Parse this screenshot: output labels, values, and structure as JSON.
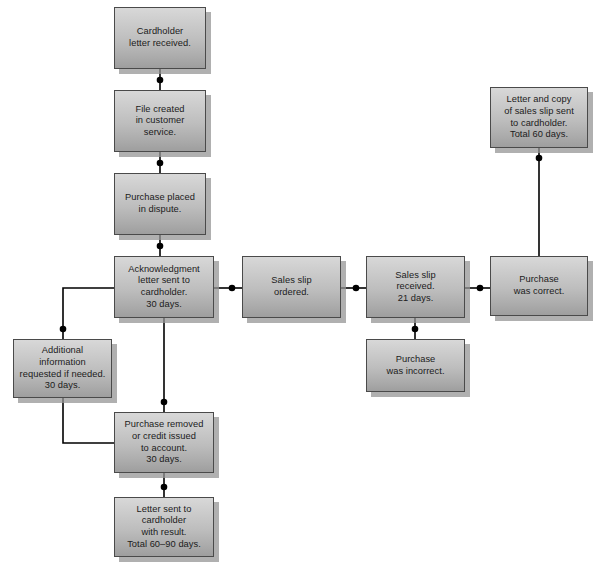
{
  "diagram": {
    "type": "flowchart",
    "background_color": "#ffffff",
    "node_fill_top": "#d8d8d8",
    "node_fill_bottom": "#9e9e9e",
    "node_border_color": "#4a4a4a",
    "node_shadow_color": "#969696",
    "edge_color": "#000000",
    "text_color": "#1b1b1b"
  },
  "nodes": [
    {
      "id": "cardholder-letter-received",
      "label": "Cardholder\nletter received.",
      "footnote": "*",
      "x": 114,
      "y": 7,
      "w": 92,
      "h": 62
    },
    {
      "id": "file-created",
      "label": "File created\nin customer\nservice.",
      "x": 114,
      "y": 90,
      "w": 92,
      "h": 62
    },
    {
      "id": "purchase-placed-in-dispute",
      "label": "Purchase placed\nin dispute.",
      "x": 114,
      "y": 173,
      "w": 92,
      "h": 62
    },
    {
      "id": "acknowledgment-letter-sent",
      "label": "Acknowledgment\nletter sent to\ncardholder.\n30 days.",
      "x": 114,
      "y": 256,
      "w": 100,
      "h": 62
    },
    {
      "id": "additional-information-requested",
      "label": "Additional\ninformation\nrequested if needed.\n30 days.",
      "x": 13,
      "y": 339,
      "w": 99,
      "h": 59
    },
    {
      "id": "purchase-removed-or-credit-issued",
      "label": "Purchase removed\nor credit issued\nto account.\n30 days.",
      "x": 114,
      "y": 412,
      "w": 100,
      "h": 61
    },
    {
      "id": "letter-sent-with-result",
      "label": "Letter sent to\ncardholder\nwith result.\nTotal 60–90 days.",
      "x": 114,
      "y": 497,
      "w": 100,
      "h": 60
    },
    {
      "id": "sales-slip-ordered",
      "label": "Sales slip\nordered.",
      "x": 242,
      "y": 256,
      "w": 99,
      "h": 62
    },
    {
      "id": "sales-slip-received",
      "label": "Sales slip\nreceived.\n21 days.",
      "x": 366,
      "y": 256,
      "w": 99,
      "h": 62
    },
    {
      "id": "purchase-was-incorrect",
      "label": "Purchase\nwas incorrect.",
      "x": 366,
      "y": 339,
      "w": 99,
      "h": 53
    },
    {
      "id": "purchase-was-correct",
      "label": "Purchase\nwas correct.",
      "x": 490,
      "y": 256,
      "w": 98,
      "h": 60
    },
    {
      "id": "letter-and-copy-of-sales-slip",
      "label": "Letter and copy\nof sales slip sent\nto cardholder.\nTotal 60 days.",
      "x": 490,
      "y": 87,
      "w": 98,
      "h": 61
    }
  ],
  "edges": [
    {
      "id": "e-letter-to-file",
      "from": "cardholder-letter-received",
      "to": "file-created",
      "points": "160,69 160,90",
      "dot": [
        160,
        80
      ]
    },
    {
      "id": "e-file-to-dispute",
      "from": "file-created",
      "to": "purchase-placed-in-dispute",
      "points": "160,152 160,173",
      "dot": [
        160,
        163
      ]
    },
    {
      "id": "e-dispute-to-ack",
      "from": "purchase-placed-in-dispute",
      "to": "acknowledgment-letter-sent",
      "points": "160,235 160,256",
      "dot": [
        160,
        246
      ]
    },
    {
      "id": "e-ack-to-additional-info",
      "from": "acknowledgment-letter-sent",
      "to": "additional-information-requested",
      "points": "114,288 63,288 63,339",
      "dot": [
        63,
        329
      ]
    },
    {
      "id": "e-additional-info-to-removed",
      "from": "additional-information-requested",
      "to": "purchase-removed-or-credit-issued",
      "points": "63,398 63,443 114,443",
      "dot": null
    },
    {
      "id": "e-ack-to-removed",
      "from": "acknowledgment-letter-sent",
      "to": "purchase-removed-or-credit-issued",
      "points": "164,318 164,412",
      "dot": [
        164,
        402
      ]
    },
    {
      "id": "e-removed-to-letter-result",
      "from": "purchase-removed-or-credit-issued",
      "to": "letter-sent-with-result",
      "points": "164,473 164,497",
      "dot": [
        164,
        487
      ]
    },
    {
      "id": "e-ack-to-slip-ordered",
      "from": "acknowledgment-letter-sent",
      "to": "sales-slip-ordered",
      "points": "214,288 242,288",
      "dot": [
        232,
        288
      ]
    },
    {
      "id": "e-slip-ordered-to-slip-received",
      "from": "sales-slip-ordered",
      "to": "sales-slip-received",
      "points": "341,288 366,288",
      "dot": [
        356,
        288
      ]
    },
    {
      "id": "e-slip-received-to-incorrect",
      "from": "sales-slip-received",
      "to": "purchase-was-incorrect",
      "points": "415,318 415,339",
      "dot": [
        415,
        329
      ]
    },
    {
      "id": "e-slip-received-to-correct",
      "from": "sales-slip-received",
      "to": "purchase-was-correct",
      "points": "465,288 490,288",
      "dot": [
        480,
        288
      ]
    },
    {
      "id": "e-correct-to-letter-copy",
      "from": "purchase-was-correct",
      "to": "letter-and-copy-of-sales-slip",
      "points": "539,256 539,148",
      "dot": [
        539,
        158
      ]
    }
  ]
}
